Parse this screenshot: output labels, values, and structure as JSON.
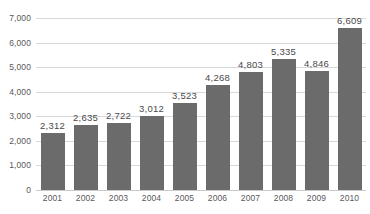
{
  "chart_data": {
    "type": "bar",
    "title": "",
    "subtitle": "",
    "xlabel": "",
    "ylabel": "",
    "categories": [
      "2001",
      "2002",
      "2003",
      "2004",
      "2005",
      "2006",
      "2007",
      "2008",
      "2009",
      "2010"
    ],
    "values": [
      2312,
      2635,
      2722,
      3012,
      3523,
      4268,
      4803,
      5335,
      4846,
      6609
    ],
    "data_labels": [
      "2,312",
      "2,635",
      "2,722",
      "3,012",
      "3,523",
      "4,268",
      "4,803",
      "5,335",
      "4,846",
      "6,609"
    ],
    "ylim": [
      0,
      7000
    ],
    "y_ticks": [
      0,
      1000,
      2000,
      3000,
      4000,
      5000,
      6000,
      7000
    ],
    "y_tick_labels": [
      "0",
      "1,000",
      "2,000",
      "3,000",
      "4,000",
      "5,000",
      "6,000",
      "7,000"
    ],
    "grid": true,
    "grid_axis": "y",
    "legend": false,
    "legend_position": "none",
    "series": [
      {
        "name": "",
        "values": [
          2312,
          2635,
          2722,
          3012,
          3523,
          4268,
          4803,
          5335,
          4846,
          6609
        ],
        "color": "#6b6b6b"
      }
    ],
    "colors": {
      "bar": "#6b6b6b",
      "gridline": "#d9d9d9",
      "baseline": "#c9c9c9",
      "axis_text": "#59595b",
      "label_text": "#4a4a4c",
      "background": "#ffffff"
    }
  }
}
